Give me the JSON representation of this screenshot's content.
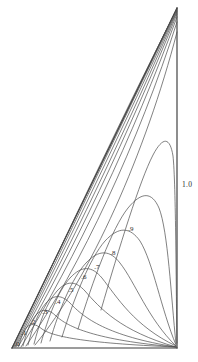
{
  "figure": {
    "title": "",
    "background_color": "#ffffff",
    "line_color": "#3a3a3a",
    "curve_color": "#4a4a4a",
    "label_color": "#2b2b2b"
  },
  "axis": {
    "right_edge_label": "1.0"
  },
  "chart_data": {
    "type": "line",
    "title": "",
    "xlabel": "",
    "ylabel": "",
    "grid": false,
    "legend": "none",
    "xlim": [
      0,
      1
    ],
    "ylim": [
      0,
      1
    ],
    "triangle_vertices": [
      {
        "name": "apex",
        "x": 177,
        "y": 8
      },
      {
        "name": "bottom-right",
        "x": 177,
        "y": 348
      },
      {
        "name": "bottom-left",
        "x": 12,
        "y": 348
      }
    ],
    "contour_levels": [
      ".0",
      ".1",
      ".2",
      ".3",
      ".4",
      ".5",
      ".6",
      ".7",
      ".8",
      ".9",
      "1.0"
    ],
    "labels": [
      {
        "text": ".0",
        "x": 17,
        "y": 344
      },
      {
        "text": ".1",
        "x": 24,
        "y": 333
      },
      {
        "text": ".2",
        "x": 33,
        "y": 322
      },
      {
        "text": ".3",
        "x": 45,
        "y": 312
      },
      {
        "text": ".4",
        "x": 58,
        "y": 302
      },
      {
        "text": ".5",
        "x": 71,
        "y": 290
      },
      {
        "text": ".6",
        "x": 84,
        "y": 277
      },
      {
        "text": ".7",
        "x": 97,
        "y": 267
      },
      {
        "text": ".8",
        "x": 113,
        "y": 253
      },
      {
        "text": ".9",
        "x": 131,
        "y": 229
      },
      {
        "text": "1.0",
        "x": 182,
        "y": 185
      }
    ],
    "curves": [
      {
        "level": ".1",
        "path": "M 19 346 C 21 338, 23 331, 27 327 C 31 323, 36 324, 42 329 C 52 336, 80 343, 176 347"
      },
      {
        "level": ".2",
        "path": "M 23 346 C 26 334, 30 322, 36 315 C 42 308, 49 309, 56 316 C 68 327, 95 340, 176 347"
      },
      {
        "level": ".3",
        "path": "M 28 345 C 32 329, 38 312, 46 303 C 54 294, 62 295, 70 303 C 84 318, 107 336, 176 347"
      },
      {
        "level": ".4",
        "path": "M 34 344 C 39 324, 47 302, 57 291 C 67 280, 76 281, 85 291 C 100 308, 120 331, 176 347"
      },
      {
        "level": ".5",
        "path": "M 41 343 C 48 318, 58 291, 70 278 C 82 265, 92 266, 102 278 C 117 297, 134 326, 176 346"
      },
      {
        "level": ".6",
        "path": "M 50 341 C 59 310, 72 278, 86 263 C 99 249, 110 250, 120 263 C 135 282, 148 319, 176 346"
      },
      {
        "level": ".7",
        "path": "M 62 337 C 74 298, 90 258, 105 241 C 119 226, 130 227, 140 241 C 153 262, 161 309, 176 345"
      },
      {
        "level": ".8",
        "path": "M 78 329 C 93 280, 112 228, 128 208 C 142 191, 152 192, 159 208 C 168 231, 171 296, 176 344"
      },
      {
        "level": ".9",
        "path": "M 101 310 C 119 248, 140 180, 153 155 C 163 136, 170 137, 173 156 C 176 183, 176 293, 177 343"
      }
    ],
    "hypotenuse_bundle": [
      {
        "path": "M 12 348 L 177 8"
      },
      {
        "path": "M 13 347 C 60 250, 120 120, 177 9"
      },
      {
        "path": "M 14 347 C 62 251, 122 122, 177 10"
      },
      {
        "path": "M 15 347 C 64 253, 124 124, 177 11"
      },
      {
        "path": "M 16 347 C 67 255, 127 127, 177 12"
      },
      {
        "path": "M 18 347 C 70 258, 130 130, 177 14"
      },
      {
        "path": "M 21 347 C 74 262, 134 134, 177 17"
      },
      {
        "path": "M 26 346 C 80 268, 139 141, 177 22"
      },
      {
        "path": "M 35 345 C 90 278, 146 152, 177 32"
      }
    ]
  }
}
